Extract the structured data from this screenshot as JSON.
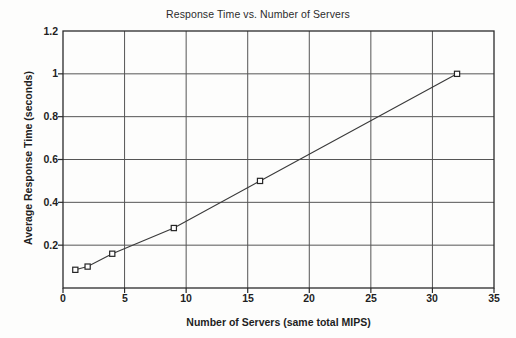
{
  "chart_data": {
    "type": "line",
    "title": "Response Time vs. Number of Servers",
    "xlabel": "Number of Servers (same total MIPS)",
    "ylabel": "Average Response Time (seconds)",
    "xlim": [
      0,
      35
    ],
    "ylim": [
      0,
      1.2
    ],
    "xticks": [
      "0",
      "5",
      "10",
      "15",
      "20",
      "25",
      "30",
      "35"
    ],
    "xtick_values": [
      0,
      5,
      10,
      15,
      20,
      25,
      30,
      35
    ],
    "yticks": [
      "0.2",
      "0.4",
      "0.6",
      "0.8",
      "1",
      "1.2"
    ],
    "ytick_values": [
      0.2,
      0.4,
      0.6,
      0.8,
      1,
      1.2
    ],
    "grid": true,
    "legend": null,
    "marker": "open-square",
    "series": [
      {
        "name": "Average Response Time",
        "x": [
          1,
          2,
          4,
          9,
          16,
          32
        ],
        "values": [
          0.085,
          0.1,
          0.16,
          0.28,
          0.5,
          1.0
        ]
      }
    ]
  },
  "style": {
    "background": "#fdfdfc",
    "line_color": "#3a3a3a",
    "grid_color": "#555555",
    "axis_color": "#2b2b2b",
    "text_color": "#1f1f1f",
    "marker_fill": "#ffffff"
  }
}
